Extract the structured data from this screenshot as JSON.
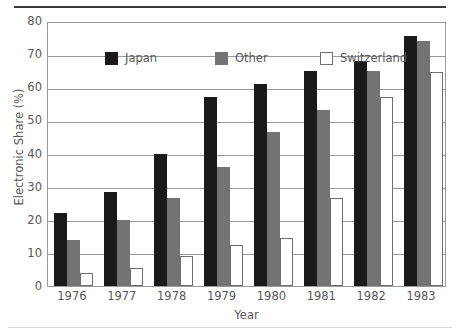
{
  "chart_data": {
    "type": "bar",
    "title": "",
    "xlabel": "Year",
    "ylabel": "Electronic Share (%)",
    "categories": [
      "1976",
      "1977",
      "1978",
      "1979",
      "1980",
      "1981",
      "1982",
      "1983"
    ],
    "series": [
      {
        "name": "Japan",
        "color": "#1a1a1a",
        "values": [
          22,
          28.5,
          40,
          57,
          61,
          65,
          68,
          75.5
        ]
      },
      {
        "name": "Other",
        "color": "#737373",
        "values": [
          14,
          20,
          26.5,
          36,
          46.5,
          53,
          65,
          74
        ]
      },
      {
        "name": "Switzerland",
        "color": "#ffffff",
        "values": [
          4,
          5.5,
          9,
          12.5,
          14.5,
          26.5,
          57,
          64.5
        ]
      }
    ],
    "ylim": [
      0,
      80
    ],
    "yticks": [
      "0",
      "10",
      "20",
      "30",
      "40",
      "50",
      "60",
      "70",
      "80"
    ],
    "grid": true,
    "legend_position": "top-left"
  }
}
